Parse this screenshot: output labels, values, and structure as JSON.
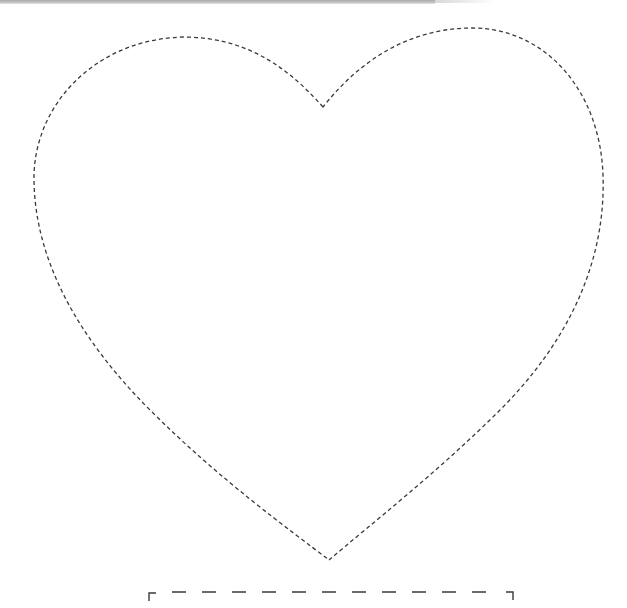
{
  "page": {
    "type": "printable-template",
    "background": "#ffffff"
  },
  "top_strip": {
    "color": "#b5b5b5"
  },
  "heart": {
    "shape": "heart-outline",
    "stroke_color": "#3a3a3a",
    "stroke_style": "dashed",
    "dash_pattern": "4 3",
    "stroke_width": 1.3,
    "notch": [
      323,
      107
    ],
    "tip": [
      329,
      560
    ],
    "left_extreme_x": 34,
    "right_extreme_x": 603,
    "left_lobe_top": [
      185,
      37
    ],
    "right_lobe_top": [
      472,
      28
    ]
  },
  "cut_bracket": {
    "stroke_color": "#3a3a3a",
    "y": 593,
    "x_start": 148,
    "x_end": 513,
    "dash_pattern": "14 16",
    "corner_drop": 8
  }
}
